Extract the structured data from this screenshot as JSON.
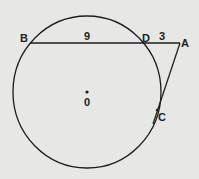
{
  "diagram": {
    "type": "circle-secant-tangent",
    "colors": {
      "background": "#e7e7e5",
      "stroke": "#1e1e1e",
      "text": "#222222"
    },
    "circle": {
      "center_label": "0",
      "cx": 87,
      "cy": 92,
      "rx": 74,
      "ry": 76
    },
    "points": {
      "B": {
        "label": "B",
        "x": 30,
        "y": 43
      },
      "D": {
        "label": "D",
        "x": 145,
        "y": 43
      },
      "A": {
        "label": "A",
        "x": 180,
        "y": 43
      },
      "C": {
        "label": "C",
        "x": 157,
        "y": 110
      }
    },
    "segments": {
      "BD": {
        "length_label": "9"
      },
      "DA": {
        "length_label": "3"
      }
    }
  }
}
